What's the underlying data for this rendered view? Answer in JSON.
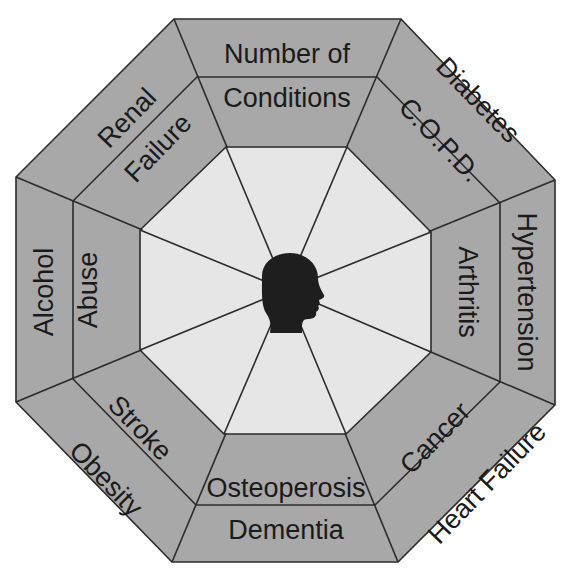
{
  "diagram": {
    "center_icon": "human-head-profile-icon",
    "colors": {
      "ring_fill": "#a8a8a8",
      "center_fill": "#e6e6e6",
      "line": "#2b2b2b",
      "head": "#1e1e1e",
      "text": "#1a1a1a"
    },
    "segments": [
      {
        "position": "top",
        "outer": "Number of",
        "inner": "Conditions"
      },
      {
        "position": "top-right",
        "outer": "Diabetes",
        "inner": "C.O.P.D."
      },
      {
        "position": "right",
        "outer": "Hypertension",
        "inner": "Arthritis"
      },
      {
        "position": "bottom-right",
        "outer": "Heart Failure",
        "inner": "Cancer"
      },
      {
        "position": "bottom",
        "outer": "Dementia",
        "inner": "Osteoperosis"
      },
      {
        "position": "bottom-left",
        "outer": "Obesity",
        "inner": "Stroke"
      },
      {
        "position": "left",
        "outer": "Alcohol",
        "inner": "Abuse"
      },
      {
        "position": "top-left",
        "outer": "Renal",
        "inner": "Failure"
      }
    ]
  }
}
